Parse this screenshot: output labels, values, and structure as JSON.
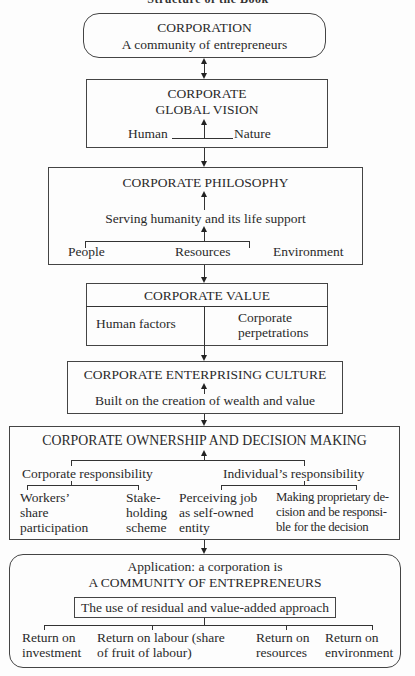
{
  "header": {
    "title_partial": "Structure of the Book"
  },
  "box1": {
    "title": "CORPORATION",
    "subtitle": "A community of entrepreneurs"
  },
  "box2": {
    "title_line1": "CORPORATE",
    "title_line2": "GLOBAL VISION",
    "left": "Human",
    "right": "Nature"
  },
  "box3": {
    "title": "CORPORATE PHILOSOPHY",
    "middle": "Serving humanity and its life support",
    "items": [
      "People",
      "Resources",
      "Environment"
    ]
  },
  "box4": {
    "title": "CORPORATE VALUE",
    "left": "Human factors",
    "right_line1": "Corporate",
    "right_line2": "perpetrations"
  },
  "box5": {
    "title": "CORPORATE ENTERPRISING CULTURE",
    "subtitle": "Built on the creation of wealth and value"
  },
  "box6": {
    "title": "CORPORATE OWNERSHIP AND DECISION MAKING",
    "left_branch": "Corporate responsibility",
    "right_branch": "Individual’s responsibility",
    "leaves": [
      {
        "lines": [
          "Workers’",
          "share",
          "participation"
        ]
      },
      {
        "lines": [
          "Stake-",
          "holding",
          "scheme"
        ]
      },
      {
        "lines": [
          "Perceiving job",
          "as self-owned",
          "entity"
        ]
      },
      {
        "lines": [
          "Making proprietary de-",
          "cision and be responsi-",
          "ble for the decision"
        ]
      }
    ]
  },
  "box7": {
    "line1": "Application: a corporation is",
    "line2": "A COMMUNITY OF ENTREPRENEURS",
    "approach": "The use of residual and value-added approach",
    "returns": [
      {
        "lines": [
          "Return on",
          "investment"
        ]
      },
      {
        "lines": [
          "Return on labour (share",
          "of fruit of labour)"
        ]
      },
      {
        "lines": [
          "Return on",
          "resources"
        ]
      },
      {
        "lines": [
          "Return on",
          "environment"
        ]
      }
    ]
  }
}
